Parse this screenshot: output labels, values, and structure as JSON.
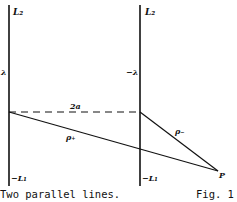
{
  "diagram": {
    "lines": {
      "left": {
        "top_label": "L₂",
        "bottom_label": "−L₁",
        "side_label": "λ"
      },
      "right": {
        "top_label": "L₂",
        "bottom_label": "−L₁",
        "side_label": "−λ"
      }
    },
    "separation_label": "2a",
    "rho_plus_label": "ρ₊",
    "rho_minus_label": "ρ₋",
    "point_label": "P",
    "stroke_color": "#111111"
  },
  "caption": {
    "text": "Two parallel lines.",
    "figure": "Fig. 1"
  }
}
